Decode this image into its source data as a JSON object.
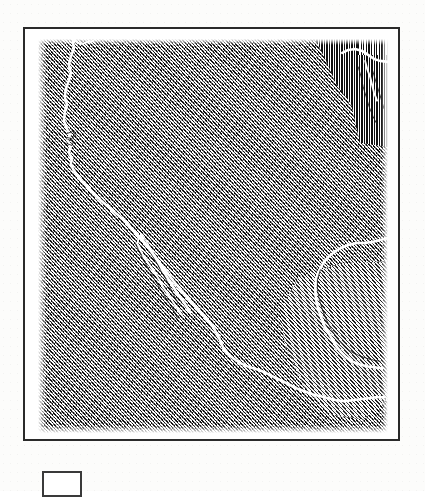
{
  "figure": {
    "kind": "scanned-engraved-map-plate",
    "title": "",
    "caption": "",
    "frame_color": "#2a2a2a",
    "paper_color": "#fcfcfb",
    "ink_color": "#111111",
    "coastline_color": "#ffffff"
  },
  "map": {
    "region_label": "North America — southwestern United States and Mexico",
    "projection_note": "",
    "fill_style": "diagonal line engraving (hatch)",
    "features": [
      {
        "name": "pacific-coastline",
        "type": "coastline"
      },
      {
        "name": "baja-california-peninsula",
        "type": "peninsula"
      },
      {
        "name": "gulf-of-california",
        "type": "gulf"
      },
      {
        "name": "gulf-of-mexico",
        "type": "gulf"
      },
      {
        "name": "yucatan-peninsula",
        "type": "peninsula"
      },
      {
        "name": "southern-mexico-coastline",
        "type": "coastline"
      },
      {
        "name": "northeast-vertical-hatch-block",
        "type": "hatch-block"
      }
    ]
  },
  "legend": {
    "box_label": "",
    "caption": ""
  }
}
